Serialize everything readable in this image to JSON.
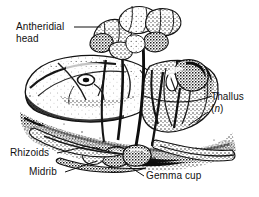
{
  "figure": {
    "organism": "Marchantia liverwort gametophyte",
    "style": "black and white stippled engraving illustration",
    "width": 259,
    "height": 197,
    "background_color": "#ffffff",
    "ink_color": "#111111"
  },
  "labels": {
    "antheridial_head": {
      "line1": "Antheridial",
      "line2": "head"
    },
    "thallus": {
      "line1": "Thallus",
      "paren_open": "(",
      "italic_n": "n",
      "paren_close": ")"
    },
    "rhizoids": "Rhizoids",
    "midrib": "Midrib",
    "gemma_cup": "Gemma cup"
  },
  "leader_lines": [
    {
      "name": "antheridial-head-leader",
      "from": [
        74,
        27
      ],
      "to": [
        101,
        27
      ]
    },
    {
      "name": "thallus-leader",
      "from": [
        208,
        112
      ],
      "to": [
        189,
        125
      ]
    },
    {
      "name": "rhizoids-leader",
      "from": [
        57,
        153
      ],
      "to": [
        88,
        146
      ]
    },
    {
      "name": "midrib-leader",
      "from": [
        65,
        172
      ],
      "to": [
        97,
        161
      ]
    },
    {
      "name": "gemma-cup-leader",
      "from": [
        144,
        176
      ],
      "to": [
        127,
        165
      ]
    }
  ]
}
